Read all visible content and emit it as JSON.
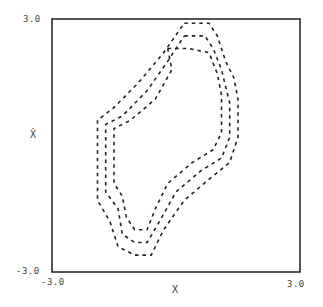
{
  "chart_data": {
    "type": "line",
    "title": "",
    "xlabel": "X",
    "ylabel": "Ẋ",
    "xlim": [
      -3.0,
      3.0
    ],
    "ylim": [
      -3.0,
      3.0
    ],
    "x_ticks": [
      "-3.0",
      "3.0"
    ],
    "y_ticks": [
      "-3.0",
      "3.0"
    ],
    "grid": false,
    "legend": null,
    "line_style": "dashed",
    "line_color": "#222222",
    "series": [
      {
        "name": "orbit-outer",
        "points": [
          [
            0.2,
            2.9
          ],
          [
            0.8,
            2.9
          ],
          [
            1.0,
            2.6
          ],
          [
            1.2,
            2.0
          ],
          [
            1.4,
            1.6
          ],
          [
            1.5,
            1.1
          ],
          [
            1.5,
            0.2
          ],
          [
            1.3,
            -0.4
          ],
          [
            0.8,
            -0.8
          ],
          [
            0.2,
            -1.3
          ],
          [
            -0.3,
            -2.0
          ],
          [
            -0.6,
            -2.6
          ],
          [
            -1.0,
            -2.6
          ],
          [
            -1.4,
            -2.4
          ],
          [
            -1.6,
            -1.8
          ],
          [
            -1.9,
            -1.3
          ],
          [
            -1.9,
            -0.2
          ],
          [
            -1.9,
            0.6
          ],
          [
            -1.5,
            0.9
          ],
          [
            -0.9,
            1.5
          ],
          [
            -0.3,
            2.2
          ],
          [
            0.2,
            2.9
          ]
        ]
      },
      {
        "name": "orbit-middle",
        "points": [
          [
            0.2,
            2.6
          ],
          [
            0.7,
            2.6
          ],
          [
            0.9,
            2.3
          ],
          [
            1.1,
            1.8
          ],
          [
            1.2,
            1.4
          ],
          [
            1.3,
            1.0
          ],
          [
            1.3,
            0.2
          ],
          [
            1.1,
            -0.3
          ],
          [
            0.6,
            -0.6
          ],
          [
            0.0,
            -1.1
          ],
          [
            -0.4,
            -1.8
          ],
          [
            -0.7,
            -2.3
          ],
          [
            -1.0,
            -2.3
          ],
          [
            -1.3,
            -2.1
          ],
          [
            -1.4,
            -1.5
          ],
          [
            -1.7,
            -1.1
          ],
          [
            -1.7,
            -0.2
          ],
          [
            -1.7,
            0.5
          ],
          [
            -1.3,
            0.7
          ],
          [
            -0.7,
            1.3
          ],
          [
            -0.2,
            2.0
          ],
          [
            0.2,
            2.6
          ]
        ]
      },
      {
        "name": "orbit-inner",
        "points": [
          [
            -0.2,
            2.3
          ],
          [
            0.3,
            2.3
          ],
          [
            0.8,
            2.2
          ],
          [
            1.0,
            1.7
          ],
          [
            1.1,
            1.2
          ],
          [
            1.1,
            0.3
          ],
          [
            0.9,
            -0.1
          ],
          [
            0.4,
            -0.4
          ],
          [
            -0.2,
            -0.9
          ],
          [
            -0.5,
            -1.5
          ],
          [
            -0.7,
            -2.0
          ],
          [
            -1.0,
            -2.0
          ],
          [
            -1.2,
            -1.7
          ],
          [
            -1.3,
            -1.2
          ],
          [
            -1.5,
            -0.9
          ],
          [
            -1.5,
            0.4
          ],
          [
            -1.1,
            0.6
          ],
          [
            -0.5,
            1.1
          ],
          [
            -0.1,
            1.8
          ],
          [
            -0.2,
            2.3
          ]
        ]
      }
    ]
  },
  "axes": {
    "x_min_label": "-3.0",
    "x_max_label": "3.0",
    "y_min_label": "-3.0",
    "y_max_label": "3.0",
    "x_label": "X",
    "y_label": "Ẋ"
  }
}
